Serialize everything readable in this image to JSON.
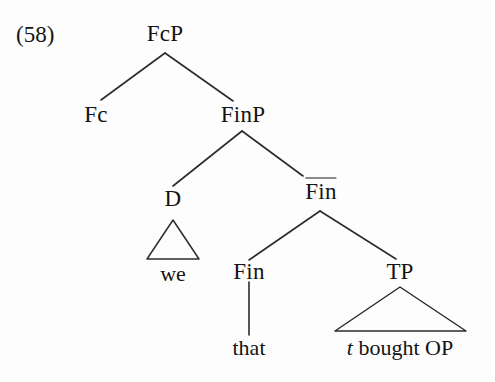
{
  "example": {
    "number": "(58)"
  },
  "tree": {
    "nodes": {
      "fcp": "FcP",
      "fc": "Fc",
      "finp": "FinP",
      "d": "D",
      "finbar": "Fin",
      "fin": "Fin",
      "tp": "TP"
    },
    "terminals": {
      "we": "we",
      "that": "that",
      "tp_phrase_trace": "t",
      "tp_phrase_rest": " bought OP",
      "tp_phrase_full": "t bought OP"
    }
  },
  "colors": {
    "ink": "#141414",
    "line": "#2b2b2b",
    "background": "#fdfdfd"
  }
}
